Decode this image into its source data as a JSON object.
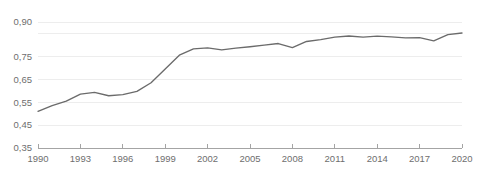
{
  "chart_data": {
    "type": "line",
    "title": "",
    "xlabel": "",
    "ylabel": "",
    "decimal_separator": ",",
    "grid": true,
    "legend": "none",
    "line_color": "#6b6b6b",
    "grid_color": "#e9e9e9",
    "axis_color": "#9a9a9a",
    "tick_label_color": "#6e6e6e",
    "xlim": [
      1990,
      2020
    ],
    "ylim": [
      0.35,
      0.9
    ],
    "ytick_values": [
      0.9,
      0.75,
      0.65,
      0.55,
      0.45,
      0.35
    ],
    "ytick_labels": [
      "0,90",
      "0,75",
      "0,65",
      "0,55",
      "0,45",
      "0,35"
    ],
    "ygrid_values": [
      0.9,
      0.85,
      0.75,
      0.65,
      0.55,
      0.45
    ],
    "xtick_values": [
      1990,
      1993,
      1996,
      1999,
      2002,
      2005,
      2008,
      2011,
      2014,
      2017,
      2020
    ],
    "xtick_labels": [
      "1990",
      "1993",
      "1996",
      "1999",
      "2002",
      "2005",
      "2008",
      "2011",
      "2014",
      "2017",
      "2020"
    ],
    "x": [
      1990,
      1991,
      1992,
      1993,
      1994,
      1995,
      1996,
      1997,
      1998,
      1999,
      2000,
      2001,
      2002,
      2003,
      2004,
      2005,
      2006,
      2007,
      2008,
      2009,
      2010,
      2011,
      2012,
      2013,
      2014,
      2015,
      2016,
      2017,
      2018,
      2019,
      2020
    ],
    "values": [
      0.51,
      0.535,
      0.555,
      0.585,
      0.593,
      0.578,
      0.583,
      0.597,
      0.635,
      0.695,
      0.755,
      0.783,
      0.787,
      0.778,
      0.786,
      0.792,
      0.799,
      0.806,
      0.788,
      0.815,
      0.823,
      0.834,
      0.839,
      0.834,
      0.838,
      0.835,
      0.831,
      0.832,
      0.818,
      0.845,
      0.852
    ],
    "series_name": ""
  }
}
